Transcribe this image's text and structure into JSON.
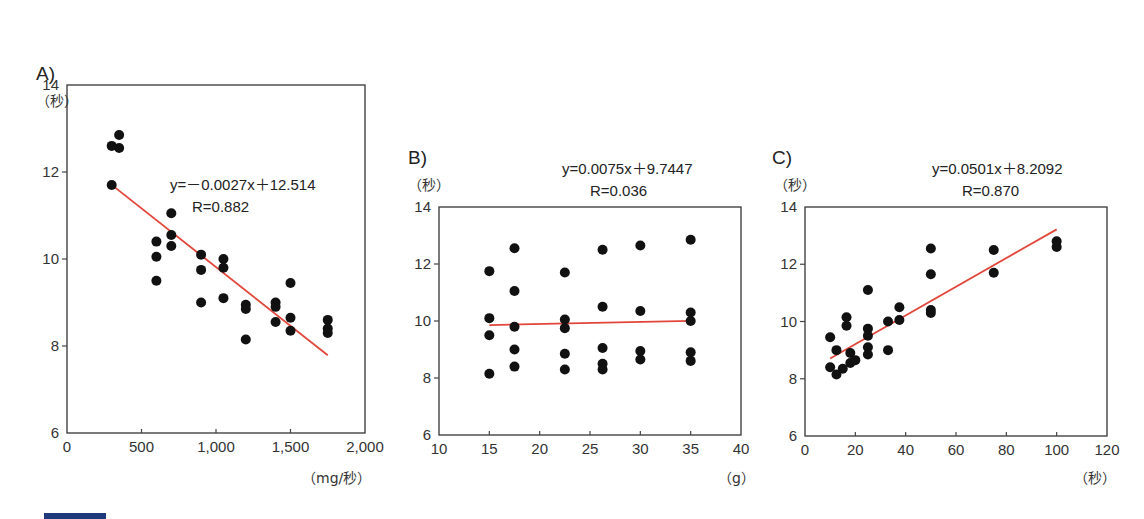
{
  "colors": {
    "fit_line": "#e2463a",
    "points": "#111111",
    "frame": "#444444",
    "footer_bar": "#1f3a7a"
  },
  "chart_data": [
    {
      "id": "A",
      "type": "scatter",
      "panel_label": "A)",
      "ylabel": "（秒）",
      "xlabel": "（mg/秒）",
      "xlim": [
        0,
        2000
      ],
      "ylim": [
        6,
        14
      ],
      "xticks": [
        0,
        500,
        1000,
        1500,
        2000
      ],
      "xtick_labels": [
        "0",
        "500",
        "1,000",
        "1,500",
        "2,000"
      ],
      "yticks": [
        6,
        8,
        10,
        12,
        14
      ],
      "ytick_labels": [
        "6",
        "8",
        "10",
        "12",
        "14"
      ],
      "equation": "y=－0.0027x＋12.514",
      "r_label": "R=0.882",
      "fit": {
        "slope": -0.0027,
        "intercept": 12.514,
        "x_range": [
          300,
          1750
        ]
      },
      "frame": {
        "x0": 67,
        "x1": 365,
        "y0": 85,
        "y1": 433
      },
      "label_pos": {
        "panel": [
          36,
          80
        ],
        "ylabel": [
          36,
          106
        ],
        "eq": [
          170,
          190
        ],
        "r": [
          192,
          212
        ],
        "xlabel": [
          302,
          483
        ]
      },
      "points": [
        [
          300,
          12.6
        ],
        [
          350,
          12.85
        ],
        [
          350,
          12.55
        ],
        [
          300,
          11.7
        ],
        [
          600,
          10.4
        ],
        [
          600,
          10.05
        ],
        [
          600,
          9.5
        ],
        [
          700,
          11.05
        ],
        [
          700,
          10.55
        ],
        [
          700,
          10.3
        ],
        [
          900,
          10.1
        ],
        [
          900,
          9.75
        ],
        [
          900,
          9.0
        ],
        [
          1050,
          10.0
        ],
        [
          1050,
          9.8
        ],
        [
          1050,
          9.1
        ],
        [
          1200,
          8.95
        ],
        [
          1200,
          8.85
        ],
        [
          1200,
          8.15
        ],
        [
          1400,
          9.0
        ],
        [
          1400,
          8.9
        ],
        [
          1400,
          8.55
        ],
        [
          1500,
          9.45
        ],
        [
          1500,
          8.65
        ],
        [
          1500,
          8.35
        ],
        [
          1750,
          8.6
        ],
        [
          1750,
          8.4
        ],
        [
          1750,
          8.3
        ]
      ]
    },
    {
      "id": "B",
      "type": "scatter",
      "panel_label": "B)",
      "ylabel": "（秒）",
      "xlabel": "（g）",
      "xlim": [
        10,
        40
      ],
      "ylim": [
        6,
        14
      ],
      "xticks": [
        10,
        15,
        20,
        25,
        30,
        35,
        40
      ],
      "xtick_labels": [
        "10",
        "15",
        "20",
        "25",
        "30",
        "35",
        "40"
      ],
      "yticks": [
        6,
        8,
        10,
        12,
        14
      ],
      "ytick_labels": [
        "6",
        "8",
        "10",
        "12",
        "14"
      ],
      "equation": "y=0.0075x＋9.7447",
      "r_label": "R=0.036",
      "fit": {
        "slope": 0.0075,
        "intercept": 9.7447,
        "x_range": [
          15,
          35
        ]
      },
      "frame": {
        "x0": 439,
        "x1": 741,
        "y0": 207,
        "y1": 435
      },
      "label_pos": {
        "panel": [
          408,
          164
        ],
        "ylabel": [
          408,
          190
        ],
        "eq": [
          562,
          174
        ],
        "r": [
          590,
          196
        ],
        "xlabel": [
          718,
          483
        ]
      },
      "points": [
        [
          15,
          11.75
        ],
        [
          15,
          10.1
        ],
        [
          15,
          9.5
        ],
        [
          15,
          8.15
        ],
        [
          17.5,
          12.55
        ],
        [
          17.5,
          11.05
        ],
        [
          17.5,
          9.8
        ],
        [
          17.5,
          9.0
        ],
        [
          17.5,
          8.4
        ],
        [
          22.5,
          11.7
        ],
        [
          22.5,
          10.05
        ],
        [
          22.5,
          9.75
        ],
        [
          22.5,
          8.85
        ],
        [
          22.5,
          8.3
        ],
        [
          26.25,
          12.5
        ],
        [
          26.25,
          10.5
        ],
        [
          26.25,
          9.05
        ],
        [
          26.25,
          8.5
        ],
        [
          26.25,
          8.3
        ],
        [
          30,
          12.65
        ],
        [
          30,
          10.35
        ],
        [
          30,
          8.95
        ],
        [
          30,
          8.65
        ],
        [
          35,
          12.85
        ],
        [
          35,
          10.3
        ],
        [
          35,
          10.0
        ],
        [
          35,
          8.9
        ],
        [
          35,
          8.6
        ]
      ]
    },
    {
      "id": "C",
      "type": "scatter",
      "panel_label": "C)",
      "ylabel": "（秒）",
      "xlabel": "（秒）",
      "xlim": [
        0,
        120
      ],
      "ylim": [
        6,
        14
      ],
      "xticks": [
        0,
        20,
        40,
        60,
        80,
        100,
        120
      ],
      "xtick_labels": [
        "0",
        "20",
        "40",
        "60",
        "80",
        "100",
        "120"
      ],
      "yticks": [
        6,
        8,
        10,
        12,
        14
      ],
      "ytick_labels": [
        "6",
        "8",
        "10",
        "12",
        "14"
      ],
      "equation": "y=0.0501x＋8.2092",
      "r_label": "R=0.870",
      "fit": {
        "slope": 0.0501,
        "intercept": 8.2092,
        "x_range": [
          10,
          100
        ]
      },
      "frame": {
        "x0": 805,
        "x1": 1107,
        "y0": 207,
        "y1": 436
      },
      "label_pos": {
        "panel": [
          772,
          164
        ],
        "ylabel": [
          774,
          190
        ],
        "eq": [
          932,
          174
        ],
        "r": [
          962,
          196
        ],
        "xlabel": [
          1074,
          483
        ]
      },
      "points": [
        [
          10,
          9.45
        ],
        [
          10,
          8.4
        ],
        [
          12.5,
          9.0
        ],
        [
          12.5,
          8.15
        ],
        [
          15,
          8.35
        ],
        [
          16.5,
          10.15
        ],
        [
          16.5,
          9.85
        ],
        [
          18,
          8.9
        ],
        [
          18,
          8.55
        ],
        [
          20,
          8.65
        ],
        [
          25,
          11.1
        ],
        [
          25,
          9.75
        ],
        [
          25,
          9.5
        ],
        [
          25,
          9.1
        ],
        [
          25,
          8.85
        ],
        [
          33,
          10.0
        ],
        [
          33,
          9.0
        ],
        [
          37.5,
          10.5
        ],
        [
          37.5,
          10.05
        ],
        [
          50,
          12.55
        ],
        [
          50,
          11.65
        ],
        [
          50,
          10.4
        ],
        [
          50,
          10.3
        ],
        [
          75,
          12.5
        ],
        [
          75,
          11.7
        ],
        [
          100,
          12.8
        ],
        [
          100,
          12.6
        ]
      ]
    }
  ]
}
